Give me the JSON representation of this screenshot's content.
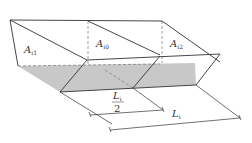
{
  "diagram": {
    "colors": {
      "stroke": "#333333",
      "shade": "#c8c8c8",
      "dash": "#777777"
    },
    "labels": {
      "a_i1": {
        "main": "A",
        "sub": "i1"
      },
      "a_i0": {
        "main": "A",
        "sub": "i0"
      },
      "a_i2": {
        "main": "A",
        "sub": "i2"
      },
      "half_length": {
        "num": "L",
        "num_sub": "i",
        "den": "2"
      },
      "length": {
        "main": "L",
        "sub": "i"
      }
    }
  }
}
